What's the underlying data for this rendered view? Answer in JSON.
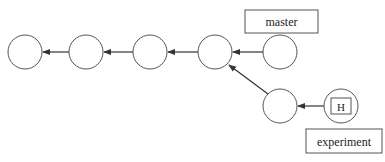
{
  "diagram": {
    "type": "git-branch-graph",
    "commits": [
      {
        "id": "c1",
        "cx": 25,
        "cy": 52
      },
      {
        "id": "c2",
        "cx": 86,
        "cy": 52
      },
      {
        "id": "c3",
        "cx": 150,
        "cy": 52
      },
      {
        "id": "c4",
        "cx": 215,
        "cy": 52
      },
      {
        "id": "c5",
        "cx": 280,
        "cy": 52
      },
      {
        "id": "c6",
        "cx": 280,
        "cy": 106
      },
      {
        "id": "c7",
        "cx": 341,
        "cy": 106
      }
    ],
    "edges": [
      {
        "from": "c2",
        "to": "c1"
      },
      {
        "from": "c3",
        "to": "c2"
      },
      {
        "from": "c4",
        "to": "c3"
      },
      {
        "from": "c5",
        "to": "c4"
      },
      {
        "from": "c6",
        "to": "c4"
      },
      {
        "from": "c7",
        "to": "c6"
      }
    ],
    "branches": {
      "master": {
        "label": "master",
        "points_to": "c5"
      },
      "experiment": {
        "label": "experiment",
        "points_to": "c7"
      }
    },
    "head": {
      "label": "H",
      "on_commit": "c7"
    },
    "colors": {
      "stroke": "#555555",
      "arrow": "#333333",
      "background": "#ffffff",
      "text": "#222222"
    }
  }
}
